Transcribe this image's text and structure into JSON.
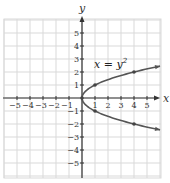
{
  "chart_data": {
    "type": "line",
    "title": "",
    "xlabel": "x",
    "ylabel": "y",
    "xlim": [
      -6,
      6
    ],
    "ylim": [
      -6,
      6
    ],
    "grid": true,
    "x_ticks": [
      -5,
      -4,
      -3,
      -2,
      -1,
      1,
      2,
      3,
      4,
      5
    ],
    "y_ticks": [
      -5,
      -4,
      -3,
      -2,
      -1,
      1,
      2,
      3,
      4,
      5
    ],
    "x_tick_labels": [
      "−5",
      "−4",
      "−3",
      "−2",
      "−1",
      "1",
      "2",
      "3",
      "4",
      "5"
    ],
    "y_tick_labels": [
      "−5",
      "−4",
      "−3",
      "−2",
      "−1",
      "1",
      "2",
      "3",
      "4",
      "5"
    ],
    "annotations": [
      {
        "text": "x = y²",
        "x": 1.8,
        "y": 2.5
      }
    ],
    "series": [
      {
        "name": "x = y^2",
        "equation": "x = y^2",
        "curve_y_range": [
          -2.45,
          2.45
        ],
        "marked_points": [
          {
            "x": 0,
            "y": 0
          },
          {
            "x": 1,
            "y": 1
          },
          {
            "x": 1,
            "y": -1
          },
          {
            "x": 4,
            "y": 2
          },
          {
            "x": 4,
            "y": -2
          }
        ]
      }
    ]
  },
  "labels": {
    "x_axis": "x",
    "y_axis": "y",
    "equation_main": "x = y",
    "equation_exp": "2"
  },
  "colors": {
    "grid": "#d9d9d9",
    "axis": "#333333",
    "curve": "#555555",
    "point": "#444444"
  }
}
